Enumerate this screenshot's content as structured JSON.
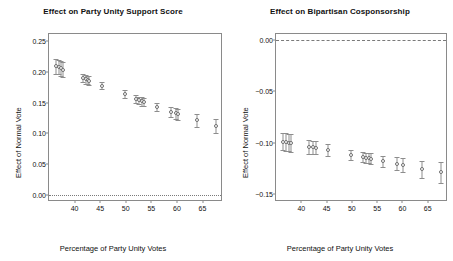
{
  "figure": {
    "width": 453,
    "height": 261,
    "background": "#ffffff",
    "marker_color": "#6f6f6f",
    "frame_color": "#8a8a8a"
  },
  "chart_data": [
    {
      "type": "scatter",
      "panel": "left",
      "title": "Effect on Party Unity Support Score",
      "xlabel": "Percentage of Party Unity Votes",
      "ylabel": "Effect of Normal Vote",
      "xlim": [
        35.0,
        69.0
      ],
      "ylim": [
        -0.012,
        0.262
      ],
      "xticks": [
        40,
        45,
        50,
        55,
        60,
        65
      ],
      "xticklabels": [
        "40",
        "45",
        "50",
        "55",
        "60",
        "65"
      ],
      "yticks": [
        0.0,
        0.05,
        0.1,
        0.15,
        0.2,
        0.25
      ],
      "yticklabels": [
        "0.00",
        "0.05",
        "0.10",
        "0.15",
        "0.20",
        "0.25"
      ],
      "grid": false,
      "legend": "none",
      "reference_line": {
        "y": 0.0,
        "style": "dotted"
      },
      "error_bars": "vertical 95% intervals with caps",
      "points": [
        {
          "x": 36.3,
          "y": 0.209,
          "lo": 0.196,
          "hi": 0.221
        },
        {
          "x": 37.0,
          "y": 0.208,
          "lo": 0.197,
          "hi": 0.219
        },
        {
          "x": 37.4,
          "y": 0.206,
          "lo": 0.194,
          "hi": 0.218
        },
        {
          "x": 37.8,
          "y": 0.204,
          "lo": 0.192,
          "hi": 0.216
        },
        {
          "x": 41.6,
          "y": 0.19,
          "lo": 0.183,
          "hi": 0.197
        },
        {
          "x": 42.3,
          "y": 0.188,
          "lo": 0.181,
          "hi": 0.195
        },
        {
          "x": 42.6,
          "y": 0.187,
          "lo": 0.18,
          "hi": 0.194
        },
        {
          "x": 42.9,
          "y": 0.186,
          "lo": 0.179,
          "hi": 0.193
        },
        {
          "x": 45.3,
          "y": 0.178,
          "lo": 0.172,
          "hi": 0.184
        },
        {
          "x": 49.8,
          "y": 0.164,
          "lo": 0.158,
          "hi": 0.17
        },
        {
          "x": 52.0,
          "y": 0.156,
          "lo": 0.15,
          "hi": 0.162
        },
        {
          "x": 52.6,
          "y": 0.154,
          "lo": 0.148,
          "hi": 0.16
        },
        {
          "x": 53.2,
          "y": 0.152,
          "lo": 0.145,
          "hi": 0.159
        },
        {
          "x": 53.6,
          "y": 0.151,
          "lo": 0.144,
          "hi": 0.158
        },
        {
          "x": 56.1,
          "y": 0.143,
          "lo": 0.136,
          "hi": 0.15
        },
        {
          "x": 58.9,
          "y": 0.135,
          "lo": 0.127,
          "hi": 0.143
        },
        {
          "x": 59.9,
          "y": 0.133,
          "lo": 0.124,
          "hi": 0.142
        },
        {
          "x": 60.3,
          "y": 0.131,
          "lo": 0.122,
          "hi": 0.14
        },
        {
          "x": 63.9,
          "y": 0.121,
          "lo": 0.111,
          "hi": 0.131
        },
        {
          "x": 67.6,
          "y": 0.112,
          "lo": 0.101,
          "hi": 0.123
        }
      ]
    },
    {
      "type": "scatter",
      "panel": "right",
      "title": "Effect on Bipartisan Cosponsorship",
      "xlabel": "Percentage of Party Unity Votes",
      "ylabel": "Effect of Normal Vote",
      "xlim": [
        35.0,
        69.0
      ],
      "ylim": [
        -0.158,
        0.006
      ],
      "xticks": [
        40,
        45,
        50,
        55,
        60,
        65
      ],
      "xticklabels": [
        "40",
        "45",
        "50",
        "55",
        "60",
        "65"
      ],
      "yticks": [
        -0.15,
        -0.1,
        -0.05,
        0.0
      ],
      "yticklabels": [
        "-0.15",
        "-0.10",
        "-0.05",
        "0.00"
      ],
      "grid": false,
      "legend": "none",
      "reference_line": {
        "y": 0.0,
        "style": "dashed"
      },
      "error_bars": "vertical 95% intervals with caps",
      "points": [
        {
          "x": 36.3,
          "y": -0.0995,
          "lo": -0.1075,
          "hi": -0.0905
        },
        {
          "x": 37.0,
          "y": -0.0998,
          "lo": -0.108,
          "hi": -0.0908
        },
        {
          "x": 37.5,
          "y": -0.1002,
          "lo": -0.1085,
          "hi": -0.0912
        },
        {
          "x": 38.0,
          "y": -0.1005,
          "lo": -0.1088,
          "hi": -0.0915
        },
        {
          "x": 41.5,
          "y": -0.1042,
          "lo": -0.1108,
          "hi": -0.0978
        },
        {
          "x": 42.4,
          "y": -0.1045,
          "lo": -0.111,
          "hi": -0.0982
        },
        {
          "x": 42.9,
          "y": -0.105,
          "lo": -0.1115,
          "hi": -0.0985
        },
        {
          "x": 45.3,
          "y": -0.1072,
          "lo": -0.1128,
          "hi": -0.1015
        },
        {
          "x": 49.9,
          "y": -0.1118,
          "lo": -0.1168,
          "hi": -0.1068
        },
        {
          "x": 52.1,
          "y": -0.1142,
          "lo": -0.1192,
          "hi": -0.1092
        },
        {
          "x": 52.7,
          "y": -0.1148,
          "lo": -0.1198,
          "hi": -0.1098
        },
        {
          "x": 53.3,
          "y": -0.1152,
          "lo": -0.1202,
          "hi": -0.1102
        },
        {
          "x": 53.8,
          "y": -0.1156,
          "lo": -0.1206,
          "hi": -0.1106
        },
        {
          "x": 56.2,
          "y": -0.1182,
          "lo": -0.1238,
          "hi": -0.1128
        },
        {
          "x": 58.9,
          "y": -0.1208,
          "lo": -0.1272,
          "hi": -0.1145
        },
        {
          "x": 60.1,
          "y": -0.1222,
          "lo": -0.1292,
          "hi": -0.1152
        },
        {
          "x": 63.9,
          "y": -0.1262,
          "lo": -0.1348,
          "hi": -0.1178
        },
        {
          "x": 67.7,
          "y": -0.1292,
          "lo": -0.1392,
          "hi": -0.1192
        }
      ]
    }
  ]
}
